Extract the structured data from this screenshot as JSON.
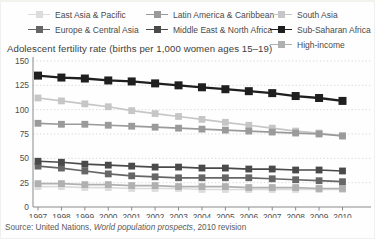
{
  "header": {
    "title": "Adolescent fertility rate (births per 1,000 women ages 15–19)"
  },
  "source": {
    "prefix": "Source: United Nations, ",
    "italic": "World population prospects",
    "suffix": ", 2010 revision"
  },
  "chart_data": {
    "type": "line",
    "title": "Adolescent fertility rate (births per 1,000 women ages 15–19)",
    "xlabel": "",
    "ylabel": "births per 1,000 women ages 15–19",
    "x": [
      1997,
      1998,
      1999,
      2000,
      2001,
      2002,
      2003,
      2004,
      2005,
      2006,
      2007,
      2008,
      2009,
      2010
    ],
    "ylim": [
      0,
      150
    ],
    "yticks": [
      0,
      25,
      50,
      75,
      100,
      125,
      150
    ],
    "grid": "dotted-horizontal",
    "legend_position": "top",
    "marker": "square",
    "axis_color": "#8a8a8a",
    "grid_color": "#d9d9d9",
    "series": [
      {
        "name": "East Asia & Pacific",
        "color": "#dcdcdc",
        "values": [
          21,
          21,
          20,
          20,
          19,
          19,
          19,
          18,
          18,
          18,
          18,
          18,
          18,
          18
        ]
      },
      {
        "name": "Latin America & Caribbean",
        "color": "#9a9a9a",
        "values": [
          86,
          85,
          85,
          84,
          83,
          82,
          81,
          80,
          79,
          78,
          77,
          76,
          75,
          73
        ]
      },
      {
        "name": "South Asia",
        "color": "#c6c6c6",
        "values": [
          112,
          109,
          106,
          103,
          99,
          96,
          93,
          90,
          87,
          84,
          81,
          78,
          76,
          73
        ]
      },
      {
        "name": "Europe & Central Asia",
        "color": "#666666",
        "values": [
          42,
          40,
          37,
          34,
          32,
          31,
          30,
          30,
          30,
          30,
          29,
          28,
          27,
          26
        ]
      },
      {
        "name": "Middle East & North Africa",
        "color": "#4a4a4a",
        "values": [
          47,
          46,
          44,
          43,
          42,
          41,
          41,
          40,
          40,
          39,
          39,
          38,
          38,
          37
        ]
      },
      {
        "name": "Sub-Saharan Africa",
        "color": "#1f1f1f",
        "values": [
          135,
          133,
          132,
          130,
          129,
          127,
          125,
          123,
          121,
          119,
          117,
          114,
          112,
          109
        ]
      },
      {
        "name": "High-income",
        "color": "#b0b0b0",
        "values": [
          24,
          24,
          23,
          23,
          22,
          22,
          21,
          21,
          21,
          20,
          20,
          20,
          19,
          19
        ]
      }
    ],
    "draw_order": [
      0,
      6,
      2,
      1,
      3,
      4,
      5
    ]
  }
}
